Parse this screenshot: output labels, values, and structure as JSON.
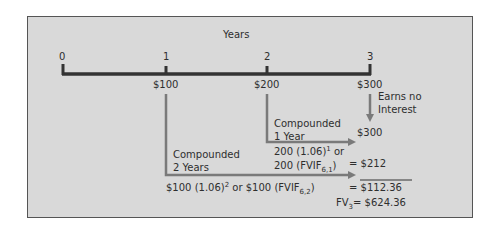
{
  "diagram": {
    "axis_label": "Years",
    "ticks": [
      "0",
      "1",
      "2",
      "3"
    ],
    "cash_flows": [
      "$100",
      "$200",
      "$300"
    ],
    "annotations": {
      "earns_no_interest_line1": "Earns no",
      "earns_no_interest_line2": "Interest",
      "compounded_1_line1": "Compounded",
      "compounded_1_line2": "1 Year",
      "formula_1a": "200 (1.06)",
      "formula_1a_sup": "1",
      "formula_1a_tail": " or",
      "formula_1b": "200 (FVIF",
      "formula_1b_sub": "6,1",
      "formula_1b_tail": ")",
      "compounded_2_line1": "Compounded",
      "compounded_2_line2": "2 Years",
      "formula_2a": "$100 (1.06)",
      "formula_2a_sup": "2",
      "formula_2a_mid": " or $100 (FVIF",
      "formula_2a_sub": "6,2",
      "formula_2a_tail": ")"
    },
    "results": {
      "r300": "$300",
      "r212": "= $212",
      "r112": "= $112.36",
      "fv_label": "FV",
      "fv_sub": "3",
      "fv_value": "= $624.36"
    },
    "colors": {
      "background": "#d9d9d9",
      "timeline": "#333333",
      "arrows": "#7a7a7a"
    }
  }
}
